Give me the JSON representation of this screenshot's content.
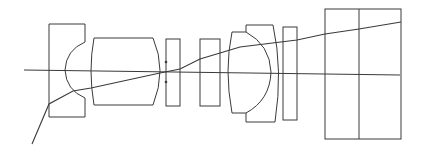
{
  "diagram": {
    "type": "optical-lens-layout",
    "colors": {
      "line": "#3a3a3a",
      "background": "#ffffff"
    },
    "elements": [
      "negative-meniscus-lens",
      "biconvex-lens",
      "plano-element-stop",
      "plano-element",
      "cemented-doublet",
      "plano-filter",
      "prism-block"
    ]
  }
}
